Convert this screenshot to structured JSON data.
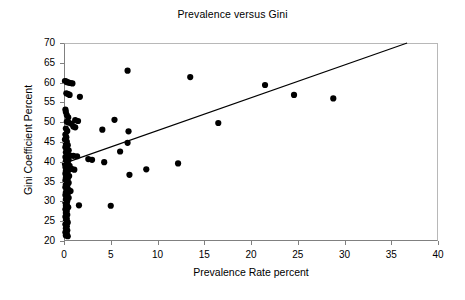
{
  "chart_data": {
    "type": "scatter",
    "title": "Prevalence versus Gini",
    "xlabel": "Prevalence Rate percent",
    "ylabel": "Gini Coefficient Percent",
    "xlim": [
      0,
      40
    ],
    "ylim": [
      20,
      70
    ],
    "xticks": [
      "0",
      "5",
      "10",
      "15",
      "20",
      "25",
      "30",
      "35",
      "40"
    ],
    "yticks": [
      "20",
      "25",
      "30",
      "35",
      "40",
      "45",
      "50",
      "55",
      "60",
      "65",
      "70"
    ],
    "grid": false,
    "legend": null,
    "marker_color": "#000000",
    "marker_shape": "circle",
    "trendline": {
      "type": "linear",
      "color": "#000000",
      "x_start": 0.0,
      "y_start": 39.6,
      "x_end": 36.7,
      "y_end": 70.0
    },
    "points": [
      [
        0.1,
        60.4
      ],
      [
        0.2,
        60.3
      ],
      [
        0.35,
        60.1
      ],
      [
        0.5,
        60.0
      ],
      [
        0.7,
        59.9
      ],
      [
        0.9,
        59.8
      ],
      [
        0.25,
        57.3
      ],
      [
        0.45,
        57.1
      ],
      [
        0.6,
        56.9
      ],
      [
        1.7,
        56.4
      ],
      [
        0.15,
        53.2
      ],
      [
        0.2,
        52.6
      ],
      [
        0.3,
        51.8
      ],
      [
        0.45,
        51.2
      ],
      [
        1.2,
        50.5
      ],
      [
        1.5,
        50.3
      ],
      [
        0.3,
        50.1
      ],
      [
        0.5,
        49.9
      ],
      [
        0.8,
        49.6
      ],
      [
        1.0,
        48.9
      ],
      [
        1.2,
        48.7
      ],
      [
        0.2,
        48.4
      ],
      [
        0.35,
        47.8
      ],
      [
        0.15,
        46.9
      ],
      [
        0.25,
        46.2
      ],
      [
        0.1,
        45.6
      ],
      [
        0.3,
        45.1
      ],
      [
        0.2,
        44.6
      ],
      [
        0.4,
        44.2
      ],
      [
        0.15,
        43.7
      ],
      [
        0.3,
        43.2
      ],
      [
        0.5,
        42.9
      ],
      [
        0.2,
        42.4
      ],
      [
        0.35,
        42.0
      ],
      [
        0.6,
        41.6
      ],
      [
        1.0,
        41.5
      ],
      [
        1.4,
        41.4
      ],
      [
        0.15,
        41.2
      ],
      [
        0.3,
        40.9
      ],
      [
        0.5,
        40.6
      ],
      [
        0.2,
        40.2
      ],
      [
        0.4,
        39.9
      ],
      [
        0.1,
        39.5
      ],
      [
        0.3,
        39.2
      ],
      [
        0.6,
        39.0
      ],
      [
        0.15,
        38.7
      ],
      [
        0.35,
        38.4
      ],
      [
        0.8,
        38.2
      ],
      [
        1.1,
        38.0
      ],
      [
        0.2,
        37.7
      ],
      [
        0.4,
        37.4
      ],
      [
        0.15,
        37.0
      ],
      [
        0.3,
        36.7
      ],
      [
        0.55,
        36.4
      ],
      [
        0.2,
        36.0
      ],
      [
        0.4,
        35.7
      ],
      [
        0.15,
        35.3
      ],
      [
        0.3,
        35.0
      ],
      [
        0.5,
        34.7
      ],
      [
        0.2,
        34.3
      ],
      [
        0.35,
        34.0
      ],
      [
        0.15,
        33.6
      ],
      [
        0.3,
        33.2
      ],
      [
        0.5,
        32.9
      ],
      [
        0.7,
        32.6
      ],
      [
        0.2,
        32.3
      ],
      [
        0.4,
        32.0
      ],
      [
        0.15,
        31.6
      ],
      [
        0.3,
        31.2
      ],
      [
        0.5,
        30.9
      ],
      [
        0.2,
        30.5
      ],
      [
        0.35,
        30.1
      ],
      [
        0.15,
        29.7
      ],
      [
        0.3,
        29.3
      ],
      [
        1.6,
        29.0
      ],
      [
        0.2,
        28.9
      ],
      [
        0.45,
        28.5
      ],
      [
        0.15,
        28.0
      ],
      [
        0.3,
        27.6
      ],
      [
        0.2,
        27.1
      ],
      [
        0.35,
        26.6
      ],
      [
        0.15,
        26.1
      ],
      [
        0.3,
        25.6
      ],
      [
        0.2,
        25.1
      ],
      [
        0.4,
        24.7
      ],
      [
        0.15,
        24.2
      ],
      [
        0.3,
        23.7
      ],
      [
        0.2,
        23.2
      ],
      [
        0.35,
        22.7
      ],
      [
        0.15,
        22.2
      ],
      [
        0.3,
        21.8
      ],
      [
        0.2,
        21.4
      ],
      [
        0.4,
        21.2
      ],
      [
        2.6,
        40.7
      ],
      [
        3.0,
        40.5
      ],
      [
        4.1,
        48.1
      ],
      [
        4.3,
        39.9
      ],
      [
        5.0,
        28.9
      ],
      [
        5.4,
        50.6
      ],
      [
        6.0,
        42.6
      ],
      [
        6.8,
        63.0
      ],
      [
        6.8,
        44.8
      ],
      [
        6.9,
        47.7
      ],
      [
        7.0,
        36.7
      ],
      [
        8.8,
        38.1
      ],
      [
        12.2,
        39.6
      ],
      [
        13.5,
        61.4
      ],
      [
        16.5,
        49.8
      ],
      [
        21.5,
        59.4
      ],
      [
        24.6,
        56.9
      ],
      [
        28.8,
        56.0
      ]
    ]
  }
}
